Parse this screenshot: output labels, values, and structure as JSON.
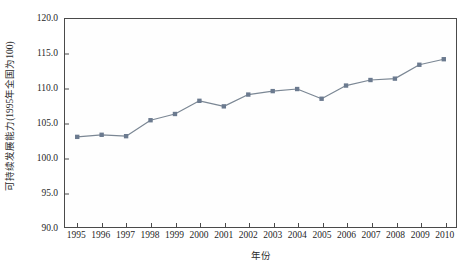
{
  "chart_data": {
    "type": "line",
    "title": "",
    "xlabel": "年份",
    "ylabel": "可持续发展能力(1995年全国为100)",
    "categories": [
      "1995",
      "1996",
      "1997",
      "1998",
      "1999",
      "2000",
      "2001",
      "2002",
      "2003",
      "2004",
      "2005",
      "2006",
      "2007",
      "2008",
      "2009",
      "2010"
    ],
    "values": [
      103.0,
      103.3,
      103.1,
      105.4,
      106.3,
      108.2,
      107.4,
      109.1,
      109.6,
      109.9,
      108.5,
      110.4,
      111.2,
      111.4,
      113.4,
      114.2
    ],
    "series": [
      {
        "name": "可持续发展能力",
        "values": [
          103.0,
          103.3,
          103.1,
          105.4,
          106.3,
          108.2,
          107.4,
          109.1,
          109.6,
          109.9,
          108.5,
          110.4,
          111.2,
          111.4,
          113.4,
          114.2
        ]
      }
    ],
    "ylim": [
      90.0,
      120.0
    ],
    "yticks": [
      90.0,
      95.0,
      100.0,
      105.0,
      110.0,
      115.0,
      120.0
    ],
    "ytick_labels": [
      "90.0",
      "95.0",
      "100.0",
      "105.0",
      "110.0",
      "115.0",
      "120.0"
    ],
    "xticks": [
      "1995",
      "1996",
      "1997",
      "1998",
      "1999",
      "2000",
      "2001",
      "2002",
      "2003",
      "2004",
      "2005",
      "2006",
      "2007",
      "2008",
      "2009",
      "2010"
    ],
    "grid": false,
    "legend": "none",
    "marker": "square",
    "line_color": "#7b8794",
    "marker_color": "#6b7a8f",
    "axis_color": "#4a4a4a",
    "plot_background": "#fefefe"
  }
}
